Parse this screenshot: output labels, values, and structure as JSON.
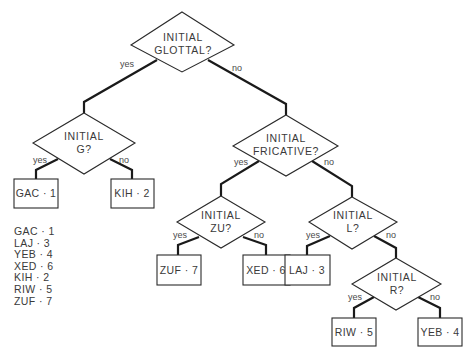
{
  "diagram": {
    "type": "decision-tree",
    "nodes": {
      "glottal": {
        "line1": "INITIAL",
        "line2": "GLOTTAL?"
      },
      "g": {
        "line1": "INITIAL",
        "line2": "G?"
      },
      "fricative": {
        "line1": "INITIAL",
        "line2": "FRICATIVE?"
      },
      "zu": {
        "line1": "INITIAL",
        "line2": "ZU?"
      },
      "l": {
        "line1": "INITIAL",
        "line2": "L?"
      },
      "r": {
        "line1": "INITIAL",
        "line2": "R?"
      }
    },
    "edge_labels": {
      "yes": "yes",
      "no": "no"
    },
    "leaves": {
      "gac": "GAC · 1",
      "kih": "KIH · 2",
      "zuf": "ZUF · 7",
      "xed": "XED · 6",
      "laj": "LAJ · 3",
      "riw": "RIW · 5",
      "yeb": "YEB · 4"
    },
    "edges": [
      {
        "from": "glottal",
        "to": "g",
        "label": "yes"
      },
      {
        "from": "glottal",
        "to": "fricative",
        "label": "no"
      },
      {
        "from": "g",
        "to": "gac",
        "label": "yes"
      },
      {
        "from": "g",
        "to": "kih",
        "label": "no"
      },
      {
        "from": "fricative",
        "to": "zu",
        "label": "yes"
      },
      {
        "from": "fricative",
        "to": "l",
        "label": "no"
      },
      {
        "from": "zu",
        "to": "zuf",
        "label": "yes"
      },
      {
        "from": "zu",
        "to": "xed",
        "label": "no"
      },
      {
        "from": "l",
        "to": "laj",
        "label": "yes"
      },
      {
        "from": "l",
        "to": "r",
        "label": "no"
      },
      {
        "from": "r",
        "to": "riw",
        "label": "yes"
      },
      {
        "from": "r",
        "to": "yeb",
        "label": "no"
      }
    ]
  },
  "legend": [
    "GAC · 1",
    "LAJ · 3",
    "YEB · 4",
    "XED · 6",
    "KIH · 2",
    "RIW · 5",
    "ZUF · 7"
  ]
}
